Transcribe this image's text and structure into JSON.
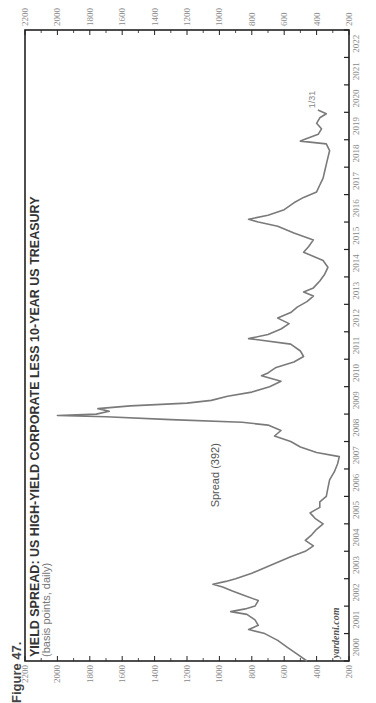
{
  "figure_label": "Figure 47.",
  "colors": {
    "line": "#777777",
    "frame": "#222222",
    "tick_text": "#8a8a8a"
  },
  "chart_data": {
    "type": "line",
    "orientation": "rotated-90-ccw",
    "title": "YIELD SPREAD: US HIGH-YIELD CORPORATE LESS 10-YEAR US TREASURY",
    "subtitle": "(basis points, daily)",
    "xlabel": "",
    "ylabel": "",
    "ylim": [
      200,
      2200
    ],
    "yticks": [
      2200,
      2000,
      1800,
      1600,
      1400,
      1200,
      1000,
      800,
      600,
      400,
      200
    ],
    "xlim": [
      2000,
      2023
    ],
    "xtick_labels": [
      "2000",
      "2001",
      "2002",
      "2003",
      "2004",
      "2005",
      "2006",
      "2007",
      "2008",
      "2009",
      "2010",
      "2011",
      "2012",
      "2013",
      "2014",
      "2015",
      "2016",
      "2017",
      "2018",
      "2019",
      "2020",
      "2021",
      "2022"
    ],
    "grid": false,
    "legend": null,
    "series": [
      {
        "name": "Spread (392)",
        "latest_value": 392,
        "end_annotation": "1/31",
        "points": [
          [
            2000.0,
            460
          ],
          [
            2000.25,
            520
          ],
          [
            2000.5,
            580
          ],
          [
            2000.75,
            640
          ],
          [
            2001.0,
            720
          ],
          [
            2001.15,
            820
          ],
          [
            2001.3,
            760
          ],
          [
            2001.5,
            780
          ],
          [
            2001.7,
            830
          ],
          [
            2001.8,
            930
          ],
          [
            2001.9,
            840
          ],
          [
            2002.0,
            780
          ],
          [
            2002.2,
            760
          ],
          [
            2002.4,
            850
          ],
          [
            2002.55,
            920
          ],
          [
            2002.7,
            980
          ],
          [
            2002.8,
            1040
          ],
          [
            2002.9,
            960
          ],
          [
            2003.0,
            900
          ],
          [
            2003.2,
            800
          ],
          [
            2003.4,
            720
          ],
          [
            2003.6,
            640
          ],
          [
            2003.8,
            560
          ],
          [
            2004.0,
            470
          ],
          [
            2004.2,
            420
          ],
          [
            2004.4,
            470
          ],
          [
            2004.6,
            430
          ],
          [
            2004.8,
            400
          ],
          [
            2005.0,
            360
          ],
          [
            2005.2,
            410
          ],
          [
            2005.4,
            440
          ],
          [
            2005.6,
            380
          ],
          [
            2005.8,
            380
          ],
          [
            2006.0,
            340
          ],
          [
            2006.3,
            330
          ],
          [
            2006.6,
            320
          ],
          [
            2006.9,
            290
          ],
          [
            2007.2,
            270
          ],
          [
            2007.45,
            260
          ],
          [
            2007.6,
            400
          ],
          [
            2007.8,
            500
          ],
          [
            2008.0,
            560
          ],
          [
            2008.2,
            660
          ],
          [
            2008.4,
            620
          ],
          [
            2008.6,
            700
          ],
          [
            2008.7,
            860
          ],
          [
            2008.8,
            1300
          ],
          [
            2008.9,
            1700
          ],
          [
            2008.95,
            2000
          ],
          [
            2009.0,
            1760
          ],
          [
            2009.1,
            1680
          ],
          [
            2009.2,
            1750
          ],
          [
            2009.3,
            1550
          ],
          [
            2009.4,
            1200
          ],
          [
            2009.5,
            1050
          ],
          [
            2009.65,
            950
          ],
          [
            2009.8,
            800
          ],
          [
            2010.0,
            690
          ],
          [
            2010.2,
            620
          ],
          [
            2010.4,
            740
          ],
          [
            2010.5,
            700
          ],
          [
            2010.7,
            650
          ],
          [
            2010.9,
            540
          ],
          [
            2011.1,
            480
          ],
          [
            2011.3,
            500
          ],
          [
            2011.55,
            560
          ],
          [
            2011.75,
            820
          ],
          [
            2011.9,
            700
          ],
          [
            2012.1,
            620
          ],
          [
            2012.3,
            570
          ],
          [
            2012.5,
            640
          ],
          [
            2012.7,
            560
          ],
          [
            2012.9,
            520
          ],
          [
            2013.1,
            460
          ],
          [
            2013.3,
            420
          ],
          [
            2013.45,
            480
          ],
          [
            2013.6,
            420
          ],
          [
            2013.85,
            380
          ],
          [
            2014.1,
            350
          ],
          [
            2014.35,
            330
          ],
          [
            2014.6,
            360
          ],
          [
            2014.9,
            480
          ],
          [
            2015.1,
            450
          ],
          [
            2015.35,
            420
          ],
          [
            2015.6,
            540
          ],
          [
            2015.85,
            640
          ],
          [
            2016.0,
            760
          ],
          [
            2016.1,
            820
          ],
          [
            2016.25,
            700
          ],
          [
            2016.45,
            600
          ],
          [
            2016.7,
            540
          ],
          [
            2016.9,
            480
          ],
          [
            2017.1,
            400
          ],
          [
            2017.35,
            380
          ],
          [
            2017.6,
            360
          ],
          [
            2017.85,
            350
          ],
          [
            2018.1,
            340
          ],
          [
            2018.35,
            330
          ],
          [
            2018.6,
            320
          ],
          [
            2018.85,
            340
          ],
          [
            2018.95,
            500
          ],
          [
            2019.05,
            460
          ],
          [
            2019.2,
            390
          ],
          [
            2019.4,
            370
          ],
          [
            2019.6,
            400
          ],
          [
            2019.8,
            380
          ],
          [
            2019.95,
            340
          ],
          [
            2020.08,
            392
          ]
        ]
      }
    ],
    "annotations": [
      {
        "text": "Spread (392)",
        "x": 2005.6,
        "y": 1000
      },
      {
        "text": "1/31",
        "x": 2020.15,
        "y": 410
      },
      {
        "text": "yardeni.com",
        "x": 2000.1,
        "y": 260
      }
    ]
  },
  "source_label": "yardeni.com"
}
